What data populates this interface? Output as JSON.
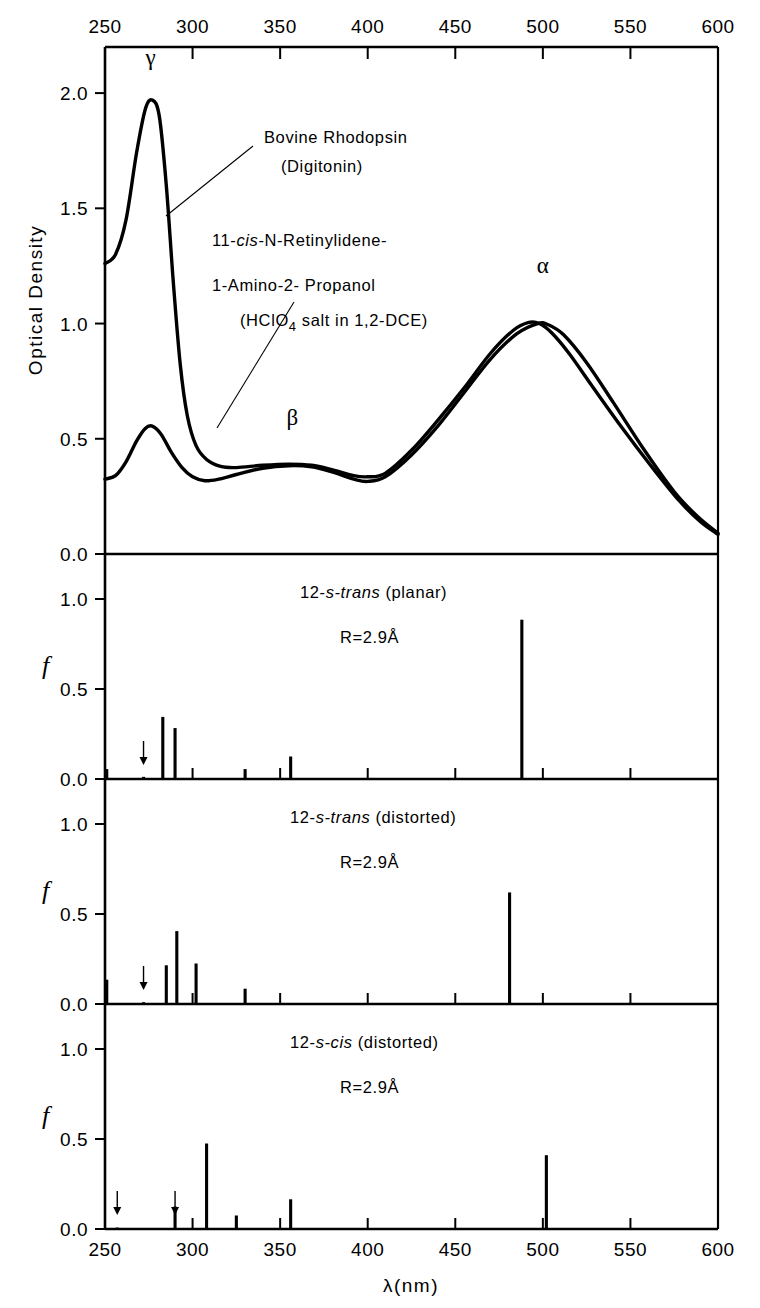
{
  "figure": {
    "x_axis_label": "λ(nm)",
    "x_ticks": [
      250,
      300,
      350,
      400,
      450,
      500,
      550,
      600
    ],
    "x_range": [
      250,
      600
    ]
  },
  "panel_top": {
    "y_axis_label": "Optical Density",
    "y_ticks": [
      "0.0",
      "0.5",
      "1.0",
      "1.5",
      "2.0"
    ],
    "y_range": [
      0.0,
      2.2
    ],
    "peak_labels": [
      {
        "name": "gamma-peak-label",
        "text": "γ",
        "x_nm": 276,
        "y_od": 2.12
      },
      {
        "name": "beta-peak-label",
        "text": "β",
        "x_nm": 357,
        "y_od": 0.56
      },
      {
        "name": "alpha-peak-label",
        "text": "α",
        "x_nm": 500,
        "y_od": 1.22
      }
    ],
    "annotations": [
      {
        "name": "rhodopsin-label-line1",
        "text": "Bovine  Rhodopsin"
      },
      {
        "name": "rhodopsin-label-line2",
        "text": "(Digitonin)"
      },
      {
        "name": "retinylidene-label-line1-pre",
        "text": "11-"
      },
      {
        "name": "retinylidene-label-line1-it",
        "text": "cis"
      },
      {
        "name": "retinylidene-label-line1-post",
        "text": "-N-Retinylidene-"
      },
      {
        "name": "retinylidene-label-line2",
        "text": "1-Amino-2- Propanol"
      },
      {
        "name": "retinylidene-label-line3-pre",
        "text": "(HClO"
      },
      {
        "name": "retinylidene-label-line3-sub",
        "text": "4"
      },
      {
        "name": "retinylidene-label-line3-post",
        "text": " salt in 1,2-DCE)"
      }
    ]
  },
  "chart_data": [
    {
      "name": "optical-density-spectra",
      "type": "line",
      "title": "Optical Density spectra",
      "xlabel": "λ(nm)",
      "ylabel": "Optical Density",
      "xlim": [
        250,
        600
      ],
      "ylim": [
        0.0,
        2.2
      ],
      "grid": false,
      "series": [
        {
          "name": "Bovine Rhodopsin (Digitonin)",
          "points": [
            [
              250,
              1.26
            ],
            [
              256,
              1.3
            ],
            [
              262,
              1.45
            ],
            [
              268,
              1.74
            ],
            [
              273,
              1.93
            ],
            [
              277,
              1.97
            ],
            [
              281,
              1.9
            ],
            [
              285,
              1.6
            ],
            [
              289,
              1.18
            ],
            [
              293,
              0.82
            ],
            [
              297,
              0.6
            ],
            [
              302,
              0.47
            ],
            [
              308,
              0.41
            ],
            [
              316,
              0.38
            ],
            [
              325,
              0.375
            ],
            [
              340,
              0.385
            ],
            [
              355,
              0.39
            ],
            [
              368,
              0.385
            ],
            [
              380,
              0.365
            ],
            [
              392,
              0.34
            ],
            [
              400,
              0.335
            ],
            [
              410,
              0.35
            ],
            [
              425,
              0.45
            ],
            [
              440,
              0.58
            ],
            [
              455,
              0.72
            ],
            [
              470,
              0.87
            ],
            [
              483,
              0.97
            ],
            [
              492,
              1.005
            ],
            [
              498,
              1.0
            ],
            [
              505,
              0.96
            ],
            [
              515,
              0.87
            ],
            [
              528,
              0.73
            ],
            [
              545,
              0.55
            ],
            [
              562,
              0.38
            ],
            [
              578,
              0.23
            ],
            [
              590,
              0.14
            ],
            [
              600,
              0.085
            ]
          ]
        },
        {
          "name": "11-cis-N-Retinylidene-1-Amino-2-Propanol (HClO4 salt in 1,2-DCE)",
          "points": [
            [
              250,
              0.325
            ],
            [
              256,
              0.34
            ],
            [
              262,
              0.4
            ],
            [
              268,
              0.49
            ],
            [
              273,
              0.545
            ],
            [
              277,
              0.555
            ],
            [
              282,
              0.52
            ],
            [
              288,
              0.44
            ],
            [
              294,
              0.375
            ],
            [
              300,
              0.335
            ],
            [
              307,
              0.318
            ],
            [
              315,
              0.325
            ],
            [
              325,
              0.345
            ],
            [
              340,
              0.372
            ],
            [
              355,
              0.383
            ],
            [
              368,
              0.378
            ],
            [
              380,
              0.355
            ],
            [
              392,
              0.325
            ],
            [
              400,
              0.315
            ],
            [
              410,
              0.335
            ],
            [
              425,
              0.43
            ],
            [
              440,
              0.555
            ],
            [
              455,
              0.7
            ],
            [
              470,
              0.845
            ],
            [
              485,
              0.955
            ],
            [
              497,
              1.0
            ],
            [
              503,
              0.995
            ],
            [
              512,
              0.95
            ],
            [
              525,
              0.83
            ],
            [
              540,
              0.66
            ],
            [
              558,
              0.45
            ],
            [
              575,
              0.27
            ],
            [
              588,
              0.165
            ],
            [
              600,
              0.09
            ]
          ]
        }
      ]
    },
    {
      "name": "stick-spectrum-12-s-trans-planar",
      "type": "bar",
      "title": "12-s-trans (planar)",
      "subtitle": "R = 2.9 Å",
      "xlabel": "λ(nm)",
      "ylabel": "f",
      "xlim": [
        250,
        600
      ],
      "ylim": [
        0.0,
        1.25
      ],
      "ytick_labels": [
        "0.0",
        "0.5",
        "1.0"
      ],
      "grid": false,
      "x": [
        251,
        272,
        283,
        290,
        330,
        356,
        488
      ],
      "values": [
        0.055,
        0.012,
        0.345,
        0.283,
        0.055,
        0.125,
        0.885
      ],
      "arrows": [
        272
      ]
    },
    {
      "name": "stick-spectrum-12-s-trans-distorted",
      "type": "bar",
      "title": "12-s-trans (distorted)",
      "subtitle": "R = 2.9 Å",
      "xlabel": "λ(nm)",
      "ylabel": "f",
      "xlim": [
        250,
        600
      ],
      "ylim": [
        0.0,
        1.25
      ],
      "ytick_labels": [
        "0.0",
        "0.5",
        "1.0"
      ],
      "grid": false,
      "x": [
        251,
        272,
        285,
        291,
        302,
        330,
        481
      ],
      "values": [
        0.135,
        0.01,
        0.215,
        0.405,
        0.225,
        0.085,
        0.62
      ],
      "arrows": [
        272
      ]
    },
    {
      "name": "stick-spectrum-12-s-cis-distorted",
      "type": "bar",
      "title": "12-s-cis  (distorted)",
      "subtitle": "R = 2.9 Å",
      "xlabel": "λ(nm)",
      "ylabel": "f",
      "xlim": [
        250,
        600
      ],
      "ylim": [
        0.0,
        1.25
      ],
      "ytick_labels": [
        "0.0",
        "0.5",
        "1.0"
      ],
      "grid": false,
      "x": [
        257,
        290,
        308,
        325,
        356,
        502
      ],
      "values": [
        0.008,
        0.125,
        0.475,
        0.075,
        0.165,
        0.41
      ],
      "arrows": [
        257,
        290
      ]
    }
  ],
  "panels": [
    {
      "name": "panel-12-s-trans-planar",
      "title_pre": "12-",
      "title_it": "s-trans",
      "title_post": " (planar)",
      "subtitle_pre": "R=2.9",
      "subtitle_unit": "Å",
      "y_axis_label": "f"
    },
    {
      "name": "panel-12-s-trans-distorted",
      "title_pre": "12-",
      "title_it": "s-trans",
      "title_post": " (distorted)",
      "subtitle_pre": "R=2.9",
      "subtitle_unit": "Å",
      "y_axis_label": "f"
    },
    {
      "name": "panel-12-s-cis-distorted",
      "title_pre": "12-",
      "title_it": "s-cis",
      "title_post": "  (distorted)",
      "subtitle_pre": "R=2.9",
      "subtitle_unit": "Å",
      "y_axis_label": "f"
    }
  ]
}
